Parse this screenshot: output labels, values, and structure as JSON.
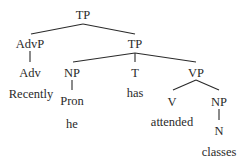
{
  "diagram": {
    "type": "syntax-tree",
    "nodes": [
      {
        "id": "tp_root",
        "label": "TP",
        "x": 83,
        "y": 15
      },
      {
        "id": "advp",
        "label": "AdvP",
        "x": 30,
        "y": 44
      },
      {
        "id": "tp_inner",
        "label": "TP",
        "x": 135,
        "y": 44
      },
      {
        "id": "adv",
        "label": "Adv",
        "x": 30,
        "y": 73
      },
      {
        "id": "np_subj",
        "label": "NP",
        "x": 72,
        "y": 73
      },
      {
        "id": "t",
        "label": "T",
        "x": 135,
        "y": 73
      },
      {
        "id": "vp",
        "label": "VP",
        "x": 196,
        "y": 73
      },
      {
        "id": "recently",
        "label": "Recently",
        "x": 31,
        "y": 94
      },
      {
        "id": "pron",
        "label": "Pron",
        "x": 72,
        "y": 101
      },
      {
        "id": "has",
        "label": "has",
        "x": 135,
        "y": 93
      },
      {
        "id": "v",
        "label": "V",
        "x": 172,
        "y": 102
      },
      {
        "id": "np_obj",
        "label": "NP",
        "x": 219,
        "y": 102
      },
      {
        "id": "he",
        "label": "he",
        "x": 72,
        "y": 124
      },
      {
        "id": "attended",
        "label": "attended",
        "x": 172,
        "y": 122
      },
      {
        "id": "n",
        "label": "N",
        "x": 219,
        "y": 131
      },
      {
        "id": "classes",
        "label": "classes",
        "x": 219,
        "y": 152
      }
    ],
    "edges": [
      {
        "from": "tp_root",
        "to": "advp",
        "x1": 83,
        "y1": 24,
        "x2": 31,
        "y2": 34
      },
      {
        "from": "tp_root",
        "to": "tp_inner",
        "x1": 83,
        "y1": 24,
        "x2": 135,
        "y2": 34
      },
      {
        "from": "advp",
        "to": "adv",
        "x1": 30,
        "y1": 51,
        "x2": 30,
        "y2": 62
      },
      {
        "from": "tp_inner",
        "to": "np_subj",
        "x1": 135,
        "y1": 53,
        "x2": 73,
        "y2": 62
      },
      {
        "from": "tp_inner",
        "to": "t",
        "x1": 135,
        "y1": 53,
        "x2": 135,
        "y2": 62
      },
      {
        "from": "tp_inner",
        "to": "vp",
        "x1": 135,
        "y1": 53,
        "x2": 196,
        "y2": 62
      },
      {
        "from": "np_subj",
        "to": "pron",
        "x1": 72,
        "y1": 80,
        "x2": 72,
        "y2": 90
      },
      {
        "from": "vp",
        "to": "v",
        "x1": 196,
        "y1": 80,
        "x2": 173,
        "y2": 90
      },
      {
        "from": "vp",
        "to": "np_obj",
        "x1": 196,
        "y1": 80,
        "x2": 219,
        "y2": 90
      },
      {
        "from": "np_obj",
        "to": "n",
        "x1": 219,
        "y1": 109,
        "x2": 219,
        "y2": 120
      }
    ]
  }
}
